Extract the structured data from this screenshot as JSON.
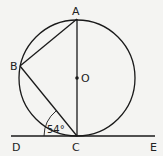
{
  "diagram": {
    "title": "",
    "colors": {
      "stroke": "#1a1a1a",
      "background": "#f4f4f2"
    },
    "points": {
      "A": {
        "label": "A"
      },
      "B": {
        "label": "B"
      },
      "C": {
        "label": "C"
      },
      "O": {
        "label": "O"
      },
      "D": {
        "label": "D"
      },
      "E": {
        "label": "E"
      }
    },
    "angle": {
      "label": "54°",
      "between": "DC and CB"
    },
    "elements": [
      "circle with center O",
      "diameter AC",
      "chord AB",
      "chord BC",
      "tangent line DE at C"
    ]
  }
}
